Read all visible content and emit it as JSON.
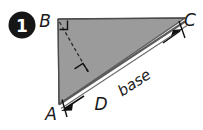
{
  "figure": {
    "badge": {
      "number": "1",
      "circle_color": "#161616",
      "text_color": "#ffffff"
    },
    "colors": {
      "triangle_fill": "#9b9b9b",
      "triangle_stroke": "#4a4a4a",
      "base_band": "#ffffff",
      "label_color": "#1a1a1a",
      "dashed_color": "#2b2b2b",
      "background": "#ffffff"
    },
    "vertices": [
      {
        "name": "B",
        "label": "B"
      },
      {
        "name": "C",
        "label": "C"
      },
      {
        "name": "A",
        "label": "A"
      }
    ],
    "points": [
      {
        "name": "D",
        "label": "D"
      }
    ],
    "segment_labels": [
      {
        "name": "base",
        "label": "base"
      }
    ],
    "marks": [
      {
        "name": "right-angle-at-B",
        "label": ""
      },
      {
        "name": "right-angle-at-D",
        "label": ""
      },
      {
        "name": "arrow-to-A",
        "label": ""
      },
      {
        "name": "arrow-to-C",
        "label": ""
      },
      {
        "name": "altitude-dashed-BD",
        "label": ""
      }
    ]
  }
}
